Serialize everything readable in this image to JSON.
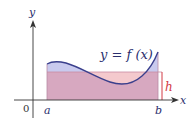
{
  "figure": {
    "curve_label": "y = f (x)",
    "axis_labels": {
      "x": "x",
      "y": "y",
      "origin": "0"
    },
    "interval_labels": {
      "a": "a",
      "b": "b"
    },
    "height_label": "h",
    "colors": {
      "curve": "#3a3f8c",
      "area_under_curve": "#c9caee",
      "rectangle": "#d7a8c0",
      "rectangle_above_curve": "#f4c9cd",
      "height_marker": "#d23a44",
      "axis": "#333333"
    }
  }
}
